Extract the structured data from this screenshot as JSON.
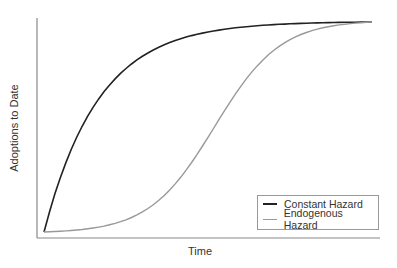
{
  "chart_data": {
    "type": "line",
    "title": "",
    "xlabel": "Time",
    "ylabel": "Adoptions to Date",
    "x": [
      0,
      0.1,
      0.2,
      0.3,
      0.4,
      0.5,
      0.6,
      0.7,
      0.8,
      0.9,
      1.0
    ],
    "series": [
      {
        "name": "Constant Hazard",
        "color": "#222222",
        "values": [
          0,
          0.45,
          0.7,
          0.83,
          0.9,
          0.94,
          0.965,
          0.98,
          0.99,
          0.995,
          1.0
        ]
      },
      {
        "name": "Endogenous Hazard",
        "color": "#999999",
        "values": [
          0,
          0.02,
          0.05,
          0.11,
          0.22,
          0.42,
          0.66,
          0.84,
          0.94,
          0.985,
          1.0
        ]
      }
    ],
    "xticks": [],
    "yticks": [],
    "grid": false,
    "legend_position": "lower right"
  },
  "legend": {
    "items": [
      {
        "label": "Constant Hazard"
      },
      {
        "label": "Endogenous Hazard"
      }
    ]
  }
}
